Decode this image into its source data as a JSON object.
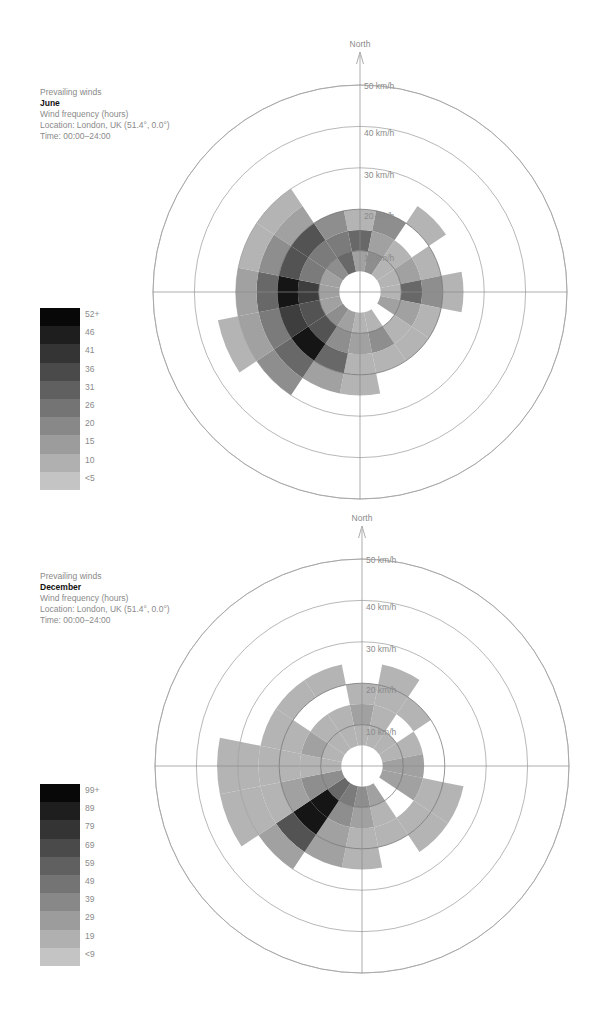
{
  "common": {
    "heading": "Prevailing winds",
    "subtitle": "Wind frequency (hours)",
    "location": "Location: London, UK (51.4°, 0.0°)",
    "time": "Time: 00:00–24:00",
    "north_label": "North",
    "ring_labels": [
      "10 km/h",
      "20 km/h",
      "30 km/h",
      "40 km/h",
      "50 km/h"
    ],
    "icons": {
      "north_arrow": "arrow-up-icon"
    }
  },
  "charts": [
    {
      "month": "June",
      "legend": [
        "52+",
        "46",
        "41",
        "36",
        "31",
        "26",
        "20",
        "15",
        "10",
        "<5"
      ]
    },
    {
      "month": "December",
      "legend": [
        "99+",
        "89",
        "79",
        "69",
        "59",
        "49",
        "39",
        "29",
        "19",
        "<9"
      ]
    }
  ],
  "chart_data": [
    {
      "type": "heatmap",
      "subtype": "polar wind rose",
      "title": "Prevailing winds — June",
      "subtitle": "Wind frequency (hours)",
      "location": "London, UK (51.4°, 0.0°)",
      "time": "00:00–24:00",
      "angular_axis": [
        "N",
        "NNE",
        "NE",
        "ENE",
        "E",
        "ESE",
        "SE",
        "SSE",
        "S",
        "SSW",
        "SW",
        "WSW",
        "W",
        "WNW",
        "NW",
        "NNW"
      ],
      "radial_axis": {
        "label": "Wind speed (km/h)",
        "ticks": [
          10,
          20,
          30,
          40,
          50
        ],
        "bin_width_kmh": 5,
        "range": [
          0,
          50
        ]
      },
      "color_scale": {
        "labels": [
          "<5",
          "10",
          "15",
          "20",
          "26",
          "31",
          "36",
          "41",
          "46",
          "52+"
        ],
        "colors": [
          "#c4c4c4",
          "#b0b0b0",
          "#9c9c9c",
          "#888888",
          "#747474",
          "#606060",
          "#4a4a4a",
          "#343434",
          "#1e1e1e",
          "#080808"
        ]
      },
      "note": "values are color-level indices 0 (<5 h) to 9 (52+ h) per 5 km/h bin starting at 5 km/h; null = no data",
      "values": {
        "N": [
          2,
          5,
          1
        ],
        "NNE": [
          3,
          2,
          3
        ],
        "NE": [
          1,
          1,
          null,
          1
        ],
        "ENE": [
          1,
          2,
          1
        ],
        "E": [
          1,
          5,
          3,
          1
        ],
        "ESE": [
          2,
          2,
          1
        ],
        "SE": [
          null,
          1,
          1
        ],
        "SSE": [
          1,
          3,
          1
        ],
        "S": [
          1,
          2,
          1,
          1
        ],
        "SSW": [
          2,
          3,
          5,
          2
        ],
        "SW": [
          3,
          6,
          9,
          5,
          3
        ],
        "WSW": [
          2,
          6,
          7,
          4,
          2,
          1
        ],
        "W": [
          2,
          7,
          9,
          5,
          2
        ],
        "WNW": [
          2,
          4,
          6,
          3,
          1
        ],
        "NW": [
          3,
          4,
          6,
          2,
          1
        ],
        "NNW": [
          5,
          4,
          3
        ]
      }
    },
    {
      "type": "heatmap",
      "subtype": "polar wind rose",
      "title": "Prevailing winds — December",
      "subtitle": "Wind frequency (hours)",
      "location": "London, UK (51.4°, 0.0°)",
      "time": "00:00–24:00",
      "angular_axis": [
        "N",
        "NNE",
        "NE",
        "ENE",
        "E",
        "ESE",
        "SE",
        "SSE",
        "S",
        "SSW",
        "SW",
        "WSW",
        "W",
        "WNW",
        "NW",
        "NNW"
      ],
      "radial_axis": {
        "label": "Wind speed (km/h)",
        "ticks": [
          10,
          20,
          30,
          40,
          50
        ],
        "bin_width_kmh": 5,
        "range": [
          0,
          50
        ]
      },
      "color_scale": {
        "labels": [
          "<9",
          "19",
          "29",
          "39",
          "49",
          "59",
          "69",
          "79",
          "89",
          "99+"
        ],
        "colors": [
          "#c4c4c4",
          "#b0b0b0",
          "#9c9c9c",
          "#888888",
          "#747474",
          "#606060",
          "#4a4a4a",
          "#343434",
          "#1e1e1e",
          "#080808"
        ]
      },
      "note": "values are color-level indices 0 (<9 h) to 9 (99+ h) per 5 km/h bin starting at 5 km/h; null = no data",
      "values": {
        "N": [
          1,
          2,
          1
        ],
        "NNE": [
          1,
          1,
          1,
          1
        ],
        "NE": [
          1,
          null,
          1
        ],
        "ENE": [
          1,
          1,
          null
        ],
        "E": [
          2,
          2,
          null
        ],
        "ESE": [
          2,
          2,
          1,
          1
        ],
        "SE": [
          null,
          null,
          1,
          1
        ],
        "SSE": [
          2,
          1,
          1,
          null
        ],
        "S": [
          3,
          2,
          1,
          1
        ],
        "SSW": [
          4,
          3,
          2,
          2
        ],
        "SW": [
          5,
          9,
          9,
          6,
          2
        ],
        "WSW": [
          3,
          3,
          2,
          1,
          1,
          1
        ],
        "W": [
          1,
          1,
          1,
          1,
          1,
          1
        ],
        "WNW": [
          1,
          2,
          1,
          1
        ],
        "NW": [
          1,
          1,
          null,
          1
        ],
        "NNW": [
          1,
          1,
          null,
          1
        ]
      }
    }
  ]
}
